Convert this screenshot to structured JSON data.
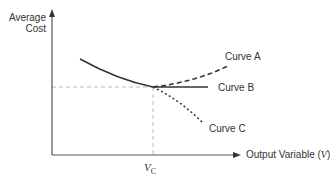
{
  "diagram": {
    "y_axis_label_line1": "Average",
    "y_axis_label_line2": "Cost",
    "x_axis_label_prefix": "Output Variable (",
    "x_axis_label_var": "V",
    "x_axis_label_suffix": ")",
    "tick_label_var": "V",
    "tick_label_sub": "C",
    "curves": [
      {
        "name": "Curve A",
        "style": "dashed",
        "trend": "rising"
      },
      {
        "name": "Curve B",
        "style": "solid",
        "trend": "flat"
      },
      {
        "name": "Curve C",
        "style": "dotted",
        "trend": "falling"
      }
    ],
    "colors": {
      "line": "#333333",
      "guide": "#bbbbbb"
    }
  }
}
